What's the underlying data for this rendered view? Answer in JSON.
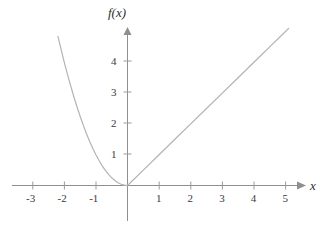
{
  "chart_data": {
    "type": "line",
    "title": "",
    "xlabel": "x",
    "ylabel": "f(x)",
    "xlim": [
      -3.65,
      5.6
    ],
    "ylim": [
      -1.15,
      5.3
    ],
    "grid": false,
    "legend": "none",
    "xticks": [
      -3,
      -2,
      -1,
      1,
      2,
      3,
      4,
      5
    ],
    "xtick_labels": [
      "-3",
      "-2",
      "-1",
      "1",
      "2",
      "3",
      "4",
      "5"
    ],
    "yticks": [
      1,
      2,
      3,
      4
    ],
    "ytick_labels": [
      "1",
      "2",
      "3",
      "4"
    ],
    "series": [
      {
        "name": "f(x) = x^2 for x < 0",
        "type": "line",
        "x": [
          -2.2,
          -2.1,
          -2.0,
          -1.9,
          -1.8,
          -1.7,
          -1.6,
          -1.5,
          -1.4,
          -1.3,
          -1.2,
          -1.1,
          -1.0,
          -0.9,
          -0.8,
          -0.7,
          -0.6,
          -0.5,
          -0.4,
          -0.3,
          -0.2,
          -0.1,
          0
        ],
        "y": [
          4.84,
          4.41,
          4.0,
          3.61,
          3.24,
          2.89,
          2.56,
          2.25,
          1.96,
          1.69,
          1.44,
          1.21,
          1.0,
          0.81,
          0.64,
          0.49,
          0.36,
          0.25,
          0.16,
          0.09,
          0.04,
          0.01,
          0
        ]
      },
      {
        "name": "f(x) = x for x >= 0",
        "type": "line",
        "x": [
          0,
          0.5,
          1,
          1.5,
          2,
          2.5,
          3,
          3.5,
          4,
          4.5,
          5,
          5.1
        ],
        "y": [
          0,
          0.5,
          1,
          1.5,
          2,
          2.5,
          3,
          3.5,
          4,
          4.5,
          5,
          5.1
        ]
      }
    ],
    "colors": {
      "curve": "#b3b3b3",
      "axis": "#8c8c8c",
      "text": "#3a3a3a",
      "background": "#ffffff"
    },
    "annotations": []
  },
  "axes": {
    "x_axis_label": "x",
    "y_axis_label": "f(x)"
  },
  "x_tick_labels": [
    "-3",
    "-2",
    "-1",
    "1",
    "2",
    "3",
    "4",
    "5"
  ],
  "y_tick_labels": [
    "1",
    "2",
    "3",
    "4"
  ]
}
